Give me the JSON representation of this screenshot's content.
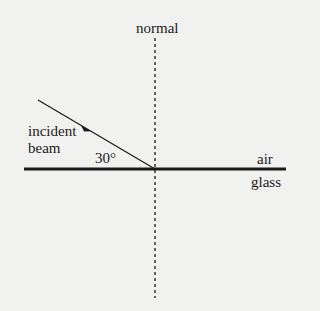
{
  "diagram": {
    "type": "refraction-setup",
    "labels": {
      "normal": "normal",
      "incident_line1": "incident",
      "incident_line2": "beam",
      "angle": "30°",
      "medium_top": "air",
      "medium_bottom": "glass"
    },
    "geometry": {
      "surface": {
        "x1": 24,
        "y1": 169,
        "x2": 286,
        "y2": 169
      },
      "normal": {
        "x": 155,
        "y1": 38,
        "y2": 298
      },
      "incident_beam": {
        "x1": 38,
        "y1": 100,
        "x2": 155,
        "y2": 169
      }
    },
    "colors": {
      "line": "#1a1a1a",
      "background": "#f1f1f0"
    }
  }
}
